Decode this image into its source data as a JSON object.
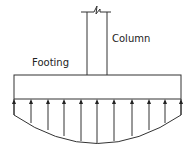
{
  "diagram": {
    "labels": {
      "column": "Column",
      "footing": "Footing"
    },
    "colors": {
      "stroke": "#333333",
      "background": "#ffffff"
    },
    "column": {
      "x_left": 87,
      "x_right": 107,
      "y_top": 12,
      "y_bottom": 75,
      "break_symbol": true
    },
    "footing": {
      "x_left": 14,
      "x_right": 181,
      "y_top": 75,
      "y_bottom": 99
    },
    "pressure_arrows": {
      "count": 11,
      "x": [
        14,
        31,
        48,
        64,
        81,
        97,
        114,
        132,
        149,
        165,
        181
      ],
      "direction": "up"
    },
    "pressure_curve": {
      "edge_y": 115,
      "center_y": 145
    }
  }
}
